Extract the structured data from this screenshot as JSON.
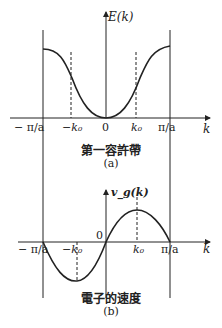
{
  "diagram": {
    "top": {
      "y_axis_label": "E(k)",
      "x_axis_label": "k",
      "ticks": [
        "− π/a",
        "−k₀",
        "0",
        "k₀",
        "π/a"
      ],
      "caption": "第一容許帶",
      "sublabel": "(a)"
    },
    "bottom": {
      "y_axis_label": "v_g(k)",
      "x_axis_label": "k",
      "origin_label": "0",
      "ticks": [
        "− π/a",
        "−k₀",
        "k₀",
        "π/a"
      ],
      "caption": "電子的速度",
      "sublabel": "(b)"
    },
    "colors": {
      "line": "#222222",
      "background": "#ffffff"
    }
  }
}
